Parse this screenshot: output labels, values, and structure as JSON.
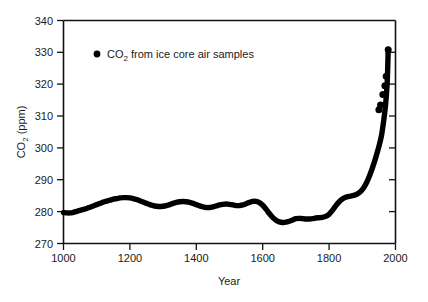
{
  "chart_data": {
    "type": "scatter",
    "title": "",
    "xlabel": "Year",
    "ylabel": "CO2 (ppm)",
    "ylabel_parts": {
      "main": "CO",
      "sub": "2",
      "unit": " (ppm)"
    },
    "xlim": [
      1000,
      2000
    ],
    "ylim": [
      270,
      340
    ],
    "xticks": [
      1000,
      1200,
      1400,
      1600,
      1800,
      2000
    ],
    "yticks": [
      270,
      280,
      290,
      300,
      310,
      320,
      330,
      340
    ],
    "grid": false,
    "legend_position": "top-left-inside",
    "legend": [
      {
        "label": "CO2 from ice core air samples",
        "label_parts": {
          "main": "CO",
          "sub": "2",
          "rest": " from ice core air samples"
        },
        "marker": "filled-circle",
        "color": "#000000"
      }
    ],
    "series": [
      {
        "name": "CO2 from ice core air samples",
        "color": "#000000",
        "marker": "filled-circle",
        "x": [
          1000,
          1010,
          1020,
          1030,
          1040,
          1050,
          1060,
          1070,
          1080,
          1090,
          1100,
          1110,
          1120,
          1130,
          1140,
          1150,
          1160,
          1170,
          1180,
          1190,
          1200,
          1210,
          1220,
          1230,
          1240,
          1250,
          1260,
          1270,
          1280,
          1290,
          1300,
          1310,
          1320,
          1330,
          1340,
          1350,
          1360,
          1370,
          1380,
          1390,
          1400,
          1410,
          1420,
          1430,
          1440,
          1450,
          1460,
          1470,
          1480,
          1490,
          1500,
          1510,
          1520,
          1530,
          1540,
          1550,
          1560,
          1570,
          1580,
          1590,
          1600,
          1610,
          1620,
          1630,
          1640,
          1650,
          1660,
          1670,
          1680,
          1690,
          1700,
          1710,
          1720,
          1730,
          1740,
          1750,
          1760,
          1770,
          1780,
          1790,
          1800,
          1810,
          1820,
          1830,
          1840,
          1850,
          1860,
          1870,
          1880,
          1890,
          1900,
          1910,
          1920,
          1930,
          1940,
          1950,
          1958,
          1965,
          1970,
          1975,
          1978
        ],
        "y": [
          279.7,
          279.6,
          279.6,
          279.8,
          280.1,
          280.4,
          280.7,
          281.0,
          281.4,
          281.8,
          282.2,
          282.6,
          283.0,
          283.3,
          283.6,
          283.9,
          284.1,
          284.3,
          284.4,
          284.4,
          284.3,
          284.1,
          283.8,
          283.4,
          283.0,
          282.6,
          282.2,
          281.9,
          281.7,
          281.6,
          281.7,
          281.9,
          282.2,
          282.6,
          282.9,
          283.1,
          283.2,
          283.1,
          282.9,
          282.6,
          282.2,
          281.8,
          281.5,
          281.3,
          281.3,
          281.5,
          281.8,
          282.1,
          282.3,
          282.4,
          282.3,
          282.1,
          281.9,
          281.9,
          282.1,
          282.5,
          282.9,
          283.2,
          283.2,
          282.8,
          282.0,
          280.8,
          279.4,
          278.2,
          277.3,
          276.8,
          276.6,
          276.7,
          277.0,
          277.4,
          277.8,
          277.9,
          277.8,
          277.7,
          277.7,
          277.8,
          278.0,
          278.1,
          278.2,
          278.5,
          279.2,
          280.4,
          281.8,
          283.1,
          284.0,
          284.5,
          284.8,
          285.0,
          285.3,
          285.9,
          286.9,
          288.5,
          290.8,
          293.6,
          296.8,
          300.5,
          304.0,
          309.0,
          313.5,
          320.5,
          330.8
        ],
        "endpoint_visible_dots": [
          {
            "x": 1950,
            "y": 312.0
          },
          {
            "x": 1955,
            "y": 313.5
          },
          {
            "x": 1962,
            "y": 316.8
          },
          {
            "x": 1968,
            "y": 319.5
          },
          {
            "x": 1972,
            "y": 322.5
          },
          {
            "x": 1978,
            "y": 330.8
          }
        ],
        "min_value": 276.6,
        "max_value": 330.8,
        "start_value": 279.7
      }
    ]
  },
  "axes": {
    "x_tick_labels": [
      "1000",
      "1200",
      "1400",
      "1600",
      "1800",
      "2000"
    ],
    "y_tick_labels": [
      "270",
      "280",
      "290",
      "300",
      "310",
      "320",
      "330",
      "340"
    ],
    "x_axis_title": "Year",
    "y_axis_title": "CO2 (ppm)"
  },
  "colors": {
    "background": "#ffffff",
    "axis": "#111111",
    "data": "#000000",
    "text": "#1a1a1a"
  }
}
